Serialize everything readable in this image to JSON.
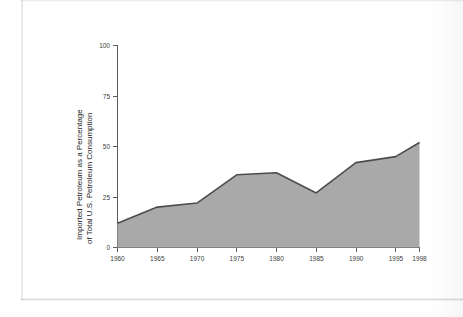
{
  "figure": {
    "background_color": "#ffffff",
    "plot_fill_color": "#a9a9a9",
    "plot_line_color": "#4d4d4d",
    "axis_color": "#5a5a5a"
  },
  "axis_titles": {
    "y_line_1": "Imported Petroleum as a Percentage",
    "y_line_2": "of Total U.S. Petroleum Consumption",
    "x": ""
  },
  "y_ticks": [
    {
      "label": "0",
      "value": 0
    },
    {
      "label": "25",
      "value": 25
    },
    {
      "label": "50",
      "value": 50
    },
    {
      "label": "75",
      "value": 75
    },
    {
      "label": "100",
      "value": 100
    }
  ],
  "x_ticks": [
    {
      "label": "1960",
      "value": 1960
    },
    {
      "label": "1965",
      "value": 1965
    },
    {
      "label": "1970",
      "value": 1970
    },
    {
      "label": "1975",
      "value": 1975
    },
    {
      "label": "1980",
      "value": 1980
    },
    {
      "label": "1985",
      "value": 1985
    },
    {
      "label": "1990",
      "value": 1990
    },
    {
      "label": "1995",
      "value": 1995
    },
    {
      "label": "1998",
      "value": 1998
    }
  ],
  "chart_data": {
    "type": "area",
    "title": "",
    "xlabel": "",
    "ylabel": "Imported Petroleum as a Percentage of Total U.S. Petroleum Consumption",
    "xlim": [
      1960,
      1998
    ],
    "ylim": [
      0,
      100
    ],
    "grid": false,
    "legend": "none",
    "x": [
      1960,
      1965,
      1970,
      1975,
      1980,
      1985,
      1990,
      1995,
      1998
    ],
    "values": [
      12,
      20,
      22,
      36,
      37,
      27,
      42,
      45,
      52
    ],
    "series": [
      {
        "name": "Imported Petroleum as a Percentage of Total U.S. Petroleum Consumption",
        "values": [
          12,
          20,
          22,
          36,
          37,
          27,
          42,
          45,
          52
        ]
      }
    ],
    "annotations": []
  }
}
